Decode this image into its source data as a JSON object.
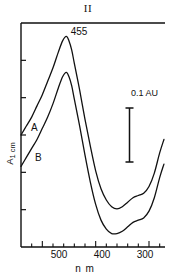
{
  "figure": {
    "title": "II",
    "peak_annotation": "455",
    "scale_bar_label": "0.1 AU",
    "y_axis_label_main": "A",
    "y_axis_label_sub": "1 cm",
    "x_axis_label": "n m",
    "curve_a_label": "A",
    "curve_b_label": "B"
  },
  "chart_data": {
    "type": "line",
    "title": "II",
    "xlabel": "nm",
    "ylabel": "A 1cm",
    "xlim": [
      540,
      270
    ],
    "x_axis_direction": "decreasing",
    "ylim": [
      0,
      1
    ],
    "grid": false,
    "legend": "inline-curve-labels",
    "xticks": [
      500,
      400,
      300
    ],
    "xtick_labels": [
      "500",
      "400",
      "300"
    ],
    "minor_xticks": [
      520,
      480,
      460,
      440,
      420,
      380,
      360,
      340,
      320,
      280
    ],
    "yticks_unlabeled": 5,
    "annotations": [
      {
        "text": "455",
        "x": 455,
        "note": "absorption maximum of curve A"
      },
      {
        "text": "0.1 AU",
        "x": 318,
        "note": "vertical scale bar spanning 0.1 absorbance units"
      },
      {
        "text": "A",
        "x": 527,
        "note": "upper trace label"
      },
      {
        "text": "B",
        "x": 520,
        "note": "lower trace label"
      }
    ],
    "series": [
      {
        "name": "A",
        "label": "A",
        "color": "#111111",
        "x": [
          540,
          530,
          520,
          510,
          500,
          490,
          480,
          470,
          462,
          455,
          450,
          445,
          440,
          430,
          420,
          410,
          400,
          390,
          380,
          370,
          360,
          350,
          340,
          330,
          320,
          310,
          300,
          290,
          280,
          272
        ],
        "values": [
          0.5,
          0.54,
          0.58,
          0.63,
          0.68,
          0.74,
          0.8,
          0.87,
          0.92,
          0.94,
          0.92,
          0.88,
          0.82,
          0.7,
          0.57,
          0.45,
          0.34,
          0.26,
          0.21,
          0.18,
          0.17,
          0.18,
          0.2,
          0.22,
          0.23,
          0.24,
          0.27,
          0.33,
          0.42,
          0.48
        ]
      },
      {
        "name": "B",
        "label": "B",
        "color": "#111111",
        "x": [
          540,
          530,
          520,
          510,
          500,
          490,
          480,
          470,
          462,
          455,
          450,
          445,
          440,
          430,
          420,
          410,
          400,
          390,
          380,
          370,
          360,
          350,
          340,
          330,
          320,
          310,
          300,
          290,
          280,
          272
        ],
        "values": [
          0.36,
          0.4,
          0.44,
          0.48,
          0.53,
          0.58,
          0.64,
          0.71,
          0.76,
          0.78,
          0.76,
          0.72,
          0.66,
          0.54,
          0.41,
          0.29,
          0.19,
          0.12,
          0.08,
          0.06,
          0.06,
          0.07,
          0.09,
          0.11,
          0.12,
          0.13,
          0.16,
          0.22,
          0.31,
          0.37
        ]
      }
    ],
    "scale_bar": {
      "label": "0.1 AU",
      "units": 0.1
    }
  }
}
